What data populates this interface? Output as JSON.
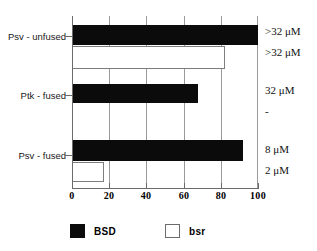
{
  "chart_data": {
    "type": "bar",
    "orientation": "horizontal",
    "title": "",
    "xlabel": "",
    "ylabel": "",
    "xlim": [
      0,
      100
    ],
    "ticks": [
      "0",
      "20",
      "40",
      "60",
      "80",
      "100"
    ],
    "tick_values": [
      0,
      20,
      40,
      60,
      80,
      100
    ],
    "grid": "vertical",
    "legend_position": "bottom",
    "categories": [
      "Psv - unfused",
      "Ptk - fused",
      "Psv - fused"
    ],
    "series": [
      {
        "name": "BSD",
        "color": "#0b0b0b",
        "values": [
          100,
          68,
          92
        ]
      },
      {
        "name": "bsr",
        "color": "#ffffff",
        "values": [
          82,
          0,
          17
        ]
      }
    ],
    "annotations": [
      {
        "series": "BSD",
        "category": "Psv - unfused",
        "text": ">32 μM"
      },
      {
        "series": "bsr",
        "category": "Psv - unfused",
        "text": ">32 μM"
      },
      {
        "series": "BSD",
        "category": "Ptk - fused",
        "text": "32 μM"
      },
      {
        "series": "bsr",
        "category": "Ptk - fused",
        "text": "-"
      },
      {
        "series": "BSD",
        "category": "Psv - fused",
        "text": "8 μM"
      },
      {
        "series": "bsr",
        "category": "Psv - fused",
        "text": "2 μM"
      }
    ]
  },
  "legend": {
    "items": [
      {
        "label": "BSD",
        "swatch": "filled"
      },
      {
        "label": "bsr",
        "swatch": "hollow"
      }
    ]
  },
  "axis": {
    "x_tick_labels": [
      "0",
      "20",
      "40",
      "60",
      "80",
      "100"
    ]
  },
  "categories": {
    "labels": [
      "Psv - unfused",
      "Ptk - fused",
      "Psv - fused"
    ]
  },
  "annotations": {
    "texts": [
      ">32 μM",
      ">32 μM",
      "32 μM",
      "-",
      "8 μM",
      "2 μM"
    ]
  }
}
